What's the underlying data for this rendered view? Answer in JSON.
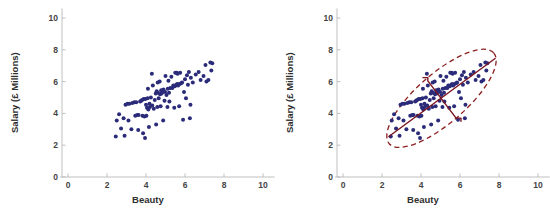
{
  "figure": {
    "background": "#ffffff",
    "width": 550,
    "height": 215
  },
  "chart_data": [
    {
      "id": "left",
      "type": "scatter",
      "title": "",
      "xlabel": "Beauty",
      "ylabel": "Salary (£ Millions)",
      "xlim": [
        0,
        10.6
      ],
      "ylim": [
        0,
        10.6
      ],
      "xticks": [
        0,
        2,
        4,
        6,
        8,
        10
      ],
      "yticks": [
        0,
        2,
        4,
        6,
        8,
        10
      ],
      "xtick_labels": [
        "0",
        "2",
        "4",
        "6",
        "8",
        "10"
      ],
      "ytick_labels": [
        "0",
        "2",
        "4",
        "6",
        "8",
        "10"
      ],
      "grid": false,
      "legend": "none",
      "marker": {
        "color": "#2b2b7a",
        "size": 2.0,
        "shape": "circle"
      },
      "points": [
        [
          2.45,
          2.55
        ],
        [
          2.5,
          3.55
        ],
        [
          2.62,
          3.95
        ],
        [
          2.72,
          3.05
        ],
        [
          2.85,
          3.7
        ],
        [
          2.9,
          2.6
        ],
        [
          2.95,
          4.55
        ],
        [
          3.05,
          4.6
        ],
        [
          3.1,
          3.55
        ],
        [
          3.15,
          4.6
        ],
        [
          3.25,
          3.0
        ],
        [
          3.3,
          4.65
        ],
        [
          3.4,
          4.7
        ],
        [
          3.45,
          3.85
        ],
        [
          3.5,
          4.7
        ],
        [
          3.55,
          3.9
        ],
        [
          3.6,
          2.95
        ],
        [
          3.62,
          3.9
        ],
        [
          3.7,
          4.75
        ],
        [
          3.75,
          4.8
        ],
        [
          3.8,
          4.85
        ],
        [
          3.82,
          3.85
        ],
        [
          3.85,
          2.75
        ],
        [
          3.88,
          4.9
        ],
        [
          3.92,
          3.8
        ],
        [
          3.95,
          2.45
        ],
        [
          3.96,
          4.9
        ],
        [
          4.0,
          4.55
        ],
        [
          4.02,
          3.85
        ],
        [
          4.05,
          4.35
        ],
        [
          4.08,
          4.95
        ],
        [
          4.1,
          5.55
        ],
        [
          4.12,
          4.25
        ],
        [
          4.15,
          3.15
        ],
        [
          4.18,
          4.6
        ],
        [
          4.2,
          4.4
        ],
        [
          4.25,
          5.0
        ],
        [
          4.3,
          6.5
        ],
        [
          4.32,
          4.5
        ],
        [
          4.35,
          5.75
        ],
        [
          4.4,
          4.3
        ],
        [
          4.45,
          4.85
        ],
        [
          4.5,
          5.25
        ],
        [
          4.52,
          3.3
        ],
        [
          4.55,
          5.4
        ],
        [
          4.58,
          4.4
        ],
        [
          4.6,
          5.95
        ],
        [
          4.62,
          5.3
        ],
        [
          4.65,
          4.95
        ],
        [
          4.7,
          6.0
        ],
        [
          4.72,
          5.2
        ],
        [
          4.75,
          4.45
        ],
        [
          4.78,
          5.45
        ],
        [
          4.8,
          5.25
        ],
        [
          4.85,
          5.35
        ],
        [
          4.88,
          3.55
        ],
        [
          4.9,
          5.5
        ],
        [
          4.95,
          4.8
        ],
        [
          4.98,
          5.35
        ],
        [
          5.0,
          6.35
        ],
        [
          5.05,
          5.15
        ],
        [
          5.1,
          4.4
        ],
        [
          5.12,
          5.55
        ],
        [
          5.15,
          6.05
        ],
        [
          5.18,
          5.3
        ],
        [
          5.2,
          4.75
        ],
        [
          5.25,
          5.6
        ],
        [
          5.3,
          6.3
        ],
        [
          5.35,
          5.6
        ],
        [
          5.4,
          5.75
        ],
        [
          5.45,
          4.35
        ],
        [
          5.48,
          5.7
        ],
        [
          5.5,
          6.55
        ],
        [
          5.55,
          5.8
        ],
        [
          5.58,
          6.55
        ],
        [
          5.6,
          5.85
        ],
        [
          5.62,
          6.5
        ],
        [
          5.65,
          5.75
        ],
        [
          5.7,
          4.45
        ],
        [
          5.72,
          5.85
        ],
        [
          5.75,
          6.55
        ],
        [
          5.8,
          5.9
        ],
        [
          5.85,
          5.95
        ],
        [
          5.9,
          3.6
        ],
        [
          5.95,
          5.35
        ],
        [
          6.0,
          6.15
        ],
        [
          6.05,
          4.95
        ],
        [
          6.1,
          6.4
        ],
        [
          6.15,
          5.8
        ],
        [
          6.2,
          6.6
        ],
        [
          6.25,
          3.7
        ],
        [
          6.28,
          4.55
        ],
        [
          6.3,
          6.25
        ],
        [
          6.4,
          5.95
        ],
        [
          6.55,
          6.45
        ],
        [
          6.7,
          6.6
        ],
        [
          6.8,
          6.1
        ],
        [
          6.95,
          6.35
        ],
        [
          7.05,
          7.05
        ],
        [
          7.1,
          6.0
        ],
        [
          7.2,
          6.1
        ],
        [
          7.3,
          7.2
        ],
        [
          7.35,
          6.7
        ],
        [
          7.4,
          7.15
        ]
      ],
      "overlays": []
    },
    {
      "id": "right",
      "type": "scatter",
      "title": "",
      "xlabel": "Beauty",
      "ylabel": "Salary (£ Millions)",
      "xlim": [
        0,
        10.6
      ],
      "ylim": [
        0,
        10.6
      ],
      "xticks": [
        0,
        2,
        4,
        6,
        8,
        10
      ],
      "yticks": [
        0,
        2,
        4,
        6,
        8,
        10
      ],
      "xtick_labels": [
        "0",
        "2",
        "4",
        "6",
        "8",
        "10"
      ],
      "ytick_labels": [
        "0",
        "2",
        "4",
        "6",
        "8",
        "10"
      ],
      "grid": false,
      "legend": "none",
      "marker": {
        "color": "#2b2b7a",
        "size": 2.0,
        "shape": "circle"
      },
      "points": [
        [
          2.45,
          2.55
        ],
        [
          2.5,
          3.55
        ],
        [
          2.62,
          3.95
        ],
        [
          2.72,
          3.05
        ],
        [
          2.85,
          3.7
        ],
        [
          2.9,
          2.6
        ],
        [
          2.95,
          4.55
        ],
        [
          3.05,
          4.6
        ],
        [
          3.1,
          3.55
        ],
        [
          3.15,
          4.6
        ],
        [
          3.25,
          3.0
        ],
        [
          3.3,
          4.65
        ],
        [
          3.4,
          4.7
        ],
        [
          3.45,
          3.85
        ],
        [
          3.5,
          4.7
        ],
        [
          3.55,
          3.9
        ],
        [
          3.6,
          2.95
        ],
        [
          3.62,
          3.9
        ],
        [
          3.7,
          4.75
        ],
        [
          3.75,
          4.8
        ],
        [
          3.8,
          4.85
        ],
        [
          3.82,
          3.85
        ],
        [
          3.85,
          2.75
        ],
        [
          3.88,
          4.9
        ],
        [
          3.92,
          3.8
        ],
        [
          3.95,
          2.45
        ],
        [
          3.96,
          4.9
        ],
        [
          4.0,
          4.55
        ],
        [
          4.02,
          3.85
        ],
        [
          4.05,
          4.35
        ],
        [
          4.08,
          4.95
        ],
        [
          4.1,
          5.55
        ],
        [
          4.12,
          4.25
        ],
        [
          4.15,
          3.15
        ],
        [
          4.18,
          4.6
        ],
        [
          4.2,
          4.4
        ],
        [
          4.25,
          5.0
        ],
        [
          4.3,
          6.5
        ],
        [
          4.32,
          4.5
        ],
        [
          4.35,
          5.75
        ],
        [
          4.4,
          4.3
        ],
        [
          4.45,
          4.85
        ],
        [
          4.5,
          5.25
        ],
        [
          4.52,
          3.3
        ],
        [
          4.55,
          5.4
        ],
        [
          4.58,
          4.4
        ],
        [
          4.6,
          5.95
        ],
        [
          4.62,
          5.3
        ],
        [
          4.65,
          4.95
        ],
        [
          4.7,
          6.0
        ],
        [
          4.72,
          5.2
        ],
        [
          4.75,
          4.45
        ],
        [
          4.78,
          5.45
        ],
        [
          4.8,
          5.25
        ],
        [
          4.85,
          5.35
        ],
        [
          4.88,
          3.55
        ],
        [
          4.9,
          5.5
        ],
        [
          4.95,
          4.8
        ],
        [
          4.98,
          5.35
        ],
        [
          5.0,
          6.35
        ],
        [
          5.05,
          5.15
        ],
        [
          5.1,
          4.4
        ],
        [
          5.12,
          5.55
        ],
        [
          5.15,
          6.05
        ],
        [
          5.18,
          5.3
        ],
        [
          5.2,
          4.75
        ],
        [
          5.25,
          5.6
        ],
        [
          5.3,
          6.3
        ],
        [
          5.35,
          5.6
        ],
        [
          5.4,
          5.75
        ],
        [
          5.45,
          4.35
        ],
        [
          5.48,
          5.7
        ],
        [
          5.5,
          6.55
        ],
        [
          5.55,
          5.8
        ],
        [
          5.58,
          6.55
        ],
        [
          5.6,
          5.85
        ],
        [
          5.62,
          6.5
        ],
        [
          5.65,
          5.75
        ],
        [
          5.7,
          4.45
        ],
        [
          5.72,
          5.85
        ],
        [
          5.75,
          6.55
        ],
        [
          5.8,
          5.9
        ],
        [
          5.85,
          5.95
        ],
        [
          5.9,
          3.6
        ],
        [
          5.95,
          5.35
        ],
        [
          6.0,
          6.15
        ],
        [
          6.05,
          4.95
        ],
        [
          6.1,
          6.4
        ],
        [
          6.15,
          5.8
        ],
        [
          6.2,
          6.6
        ],
        [
          6.25,
          3.7
        ],
        [
          6.28,
          4.55
        ],
        [
          6.3,
          6.25
        ],
        [
          6.4,
          5.95
        ],
        [
          6.55,
          6.45
        ],
        [
          6.7,
          6.6
        ],
        [
          6.8,
          6.1
        ],
        [
          6.95,
          6.35
        ],
        [
          7.05,
          7.05
        ],
        [
          7.1,
          6.0
        ],
        [
          7.2,
          6.1
        ],
        [
          7.3,
          7.2
        ],
        [
          7.35,
          6.7
        ],
        [
          7.4,
          7.15
        ]
      ],
      "overlays": [
        {
          "kind": "ellipse",
          "name": "concentration-ellipse",
          "center": [
            5.05,
            4.95
          ],
          "semi_major": 3.55,
          "semi_minor": 1.55,
          "rotation_deg": -41,
          "color": "#8c2020",
          "dashed": true,
          "line_width": 1.3
        },
        {
          "kind": "line",
          "name": "major-axis-line",
          "from": [
            2.35,
            2.55
          ],
          "to": [
            7.8,
            7.45
          ],
          "color": "#7a1520",
          "line_width": 1.4
        },
        {
          "kind": "polyline",
          "name": "minor-axis-bracket",
          "vertices": [
            [
              4.1,
              6.25
            ],
            [
              4.35,
              6.25
            ],
            [
              4.35,
              6.05
            ],
            [
              5.8,
              3.7
            ],
            [
              6.05,
              3.7
            ],
            [
              6.05,
              3.5
            ]
          ],
          "color": "#7a1520",
          "line_width": 1.4
        }
      ]
    }
  ]
}
